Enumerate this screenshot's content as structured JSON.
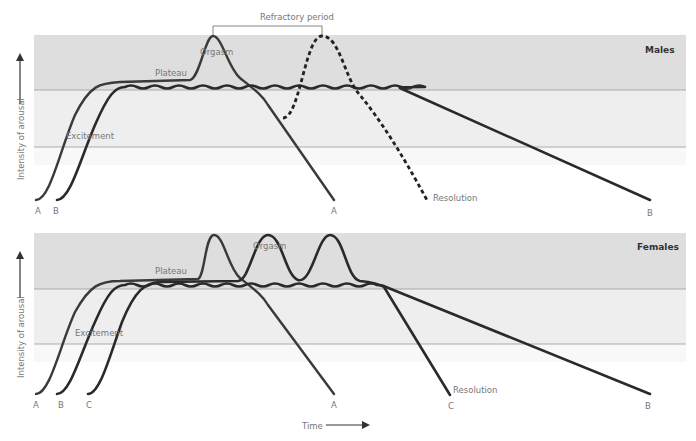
{
  "refractory_label": "Refractory period",
  "y_axis_label": "Intensity of arousal",
  "x_axis_label": "Time",
  "males": {
    "title": "Males",
    "phases": {
      "plateau": "Plateau",
      "orgasm": "Orgasm",
      "excitement": "Excitement",
      "resolution": "Resolution"
    },
    "start_labels": [
      "A",
      "B"
    ],
    "end_labels": {
      "a": "A",
      "b": "B"
    }
  },
  "females": {
    "title": "Females",
    "phases": {
      "plateau": "Plateau",
      "orgasm": "Orgasm",
      "excitement": "Excitement",
      "resolution": "Resolution"
    },
    "start_labels": [
      "A",
      "B",
      "C"
    ],
    "end_labels": {
      "a": "A",
      "c": "C",
      "b": "B"
    }
  },
  "colors": {
    "band_dark": "#dedede",
    "band_light": "#efefef",
    "curve": "#2a2a2a"
  }
}
